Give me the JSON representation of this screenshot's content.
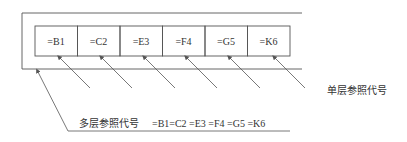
{
  "diagram": {
    "boxes": [
      {
        "label": "=B1"
      },
      {
        "label": "=C2"
      },
      {
        "label": "=E3"
      },
      {
        "label": "=F4"
      },
      {
        "label": "=G5"
      },
      {
        "label": "=K6"
      }
    ],
    "single_level_label": "单层参照代号",
    "multi_level_label": "多层参照代号",
    "multi_level_code": "=B1=C2 =E3 =F4 =G5 =K6",
    "colors": {
      "line": "#555555",
      "text": "#333333"
    }
  }
}
